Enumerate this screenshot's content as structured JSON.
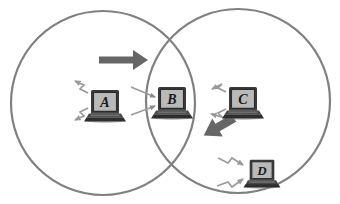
{
  "figure": {
    "kind": "venn-diagram-wireless-network",
    "background_color": "#ffffff",
    "outline_color": "#808080",
    "arrow_color": "#666666",
    "signal_color": "#999999",
    "laptop_body_color": "#3d3d3d",
    "laptop_screen_color": "#b3b3b3",
    "label_color": "#1a1a1a"
  },
  "cells": [
    {
      "name": "left-cell",
      "shape": "circle",
      "cx": 103,
      "cy": 103,
      "r": 92,
      "stroke": "#808080",
      "stroke_width": 2.2
    },
    {
      "name": "right-cell",
      "shape": "circle",
      "cx": 238,
      "cy": 101,
      "r": 92,
      "stroke": "#808080",
      "stroke_width": 2.2
    }
  ],
  "nodes": [
    {
      "id": "A",
      "label": "A",
      "x": 105,
      "y": 104,
      "scale": 1.0,
      "region": "left-cell-only",
      "signals": {
        "type": "zigzag",
        "direction": "left",
        "count": 2
      }
    },
    {
      "id": "B",
      "label": "B",
      "x": 172,
      "y": 101,
      "scale": 1.0,
      "region": "intersection",
      "signals": {
        "type": "straight",
        "direction": "incoming-right",
        "count": 2
      }
    },
    {
      "id": "C",
      "label": "C",
      "x": 243,
      "y": 101,
      "scale": 1.0,
      "region": "right-cell-only",
      "signals": {
        "type": "zigzag",
        "direction": "left",
        "count": 2
      }
    },
    {
      "id": "D",
      "label": "D",
      "x": 262,
      "y": 172,
      "scale": 0.88,
      "region": "right-cell-only",
      "signals": {
        "type": "zigzag",
        "direction": "right",
        "count": 2
      }
    }
  ],
  "movement_arrows": [
    {
      "name": "handover-arrow-a-to-b",
      "from_node": "A",
      "to_node": "B",
      "angle_deg": 0,
      "x1": 101,
      "y1": 60,
      "x2": 146,
      "y2": 60,
      "thickness": 7,
      "head_size": 9,
      "color": "#666666"
    },
    {
      "name": "handover-arrow-c-to-d",
      "from_node": "C",
      "to_node": "D",
      "angle_deg": 62,
      "x1": 236,
      "y1": 118,
      "x2": 256,
      "y2": 149,
      "thickness": 8,
      "head_size": 11,
      "color": "#666666"
    }
  ],
  "labels": {
    "node_a": "A",
    "node_b": "B",
    "node_c": "C",
    "node_d": "D"
  }
}
